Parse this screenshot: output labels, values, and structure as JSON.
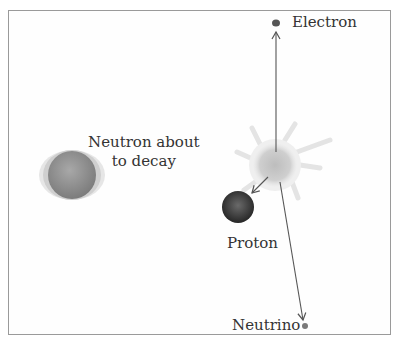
{
  "diagram": {
    "labels": {
      "neutron": [
        "Neutron about",
        "to decay"
      ],
      "electron": "Electron",
      "proton": "Proton",
      "neutrino": "Neutrino"
    },
    "colors": {
      "frame": "#9a9a9a",
      "neutron": "#8a8a8a",
      "proton": "#3a3a3a",
      "electron": "#555555",
      "neutrino": "#7a7a7a",
      "arrow": "#555555",
      "burst": "#c8c8c8"
    }
  }
}
